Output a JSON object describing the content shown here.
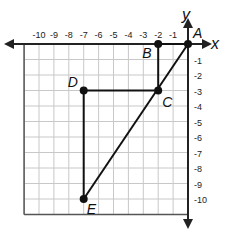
{
  "axes": {
    "x_label": "x",
    "y_label": "y",
    "x_ticks": [
      "-10",
      "-9",
      "-8",
      "-7",
      "-6",
      "-5",
      "-4",
      "-3",
      "-2",
      "-1"
    ],
    "y_ticks": [
      "-1",
      "-2",
      "-3",
      "-4",
      "-5",
      "-6",
      "-7",
      "-8",
      "-9",
      "-10"
    ],
    "x_range": [
      -11,
      0
    ],
    "y_range": [
      -11,
      0
    ]
  },
  "points": [
    {
      "label": "A",
      "x": 0,
      "y": 0
    },
    {
      "label": "B",
      "x": -2,
      "y": 0
    },
    {
      "label": "C",
      "x": -2,
      "y": -3
    },
    {
      "label": "D",
      "x": -7,
      "y": -3
    },
    {
      "label": "E",
      "x": -7,
      "y": -10
    }
  ],
  "segments": [
    [
      "A",
      "B"
    ],
    [
      "B",
      "C"
    ],
    [
      "C",
      "D"
    ],
    [
      "D",
      "E"
    ],
    [
      "E",
      "A"
    ]
  ],
  "colors": {
    "grid": "#c8c8c8",
    "axis": "#222222",
    "lines": "#111111"
  }
}
